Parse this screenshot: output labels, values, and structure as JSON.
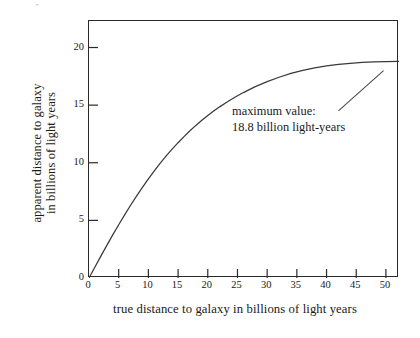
{
  "chart_data": {
    "type": "line",
    "title": "",
    "xlabel": "true distance to galaxy in billions of light years",
    "ylabel_line1": "apparent distance to galaxy",
    "ylabel_line2": "in billions of light years",
    "xlim": [
      0,
      52.2
    ],
    "ylim": [
      0,
      22.3
    ],
    "xticks": [
      0,
      5,
      10,
      15,
      20,
      25,
      30,
      35,
      40,
      45,
      50
    ],
    "xtick_labels": [
      "0",
      "5",
      "10",
      "15",
      "20",
      "25",
      "30",
      "35",
      "40",
      "45",
      "50"
    ],
    "yticks": [
      0,
      5,
      10,
      15,
      20
    ],
    "ytick_labels": [
      "0",
      "5",
      "10",
      "15",
      "20"
    ],
    "grid": false,
    "legend": "none",
    "line_color": "#3a3a3a",
    "frame_color": "#2a2a2a",
    "annotations": [
      {
        "line1": "maximum value:",
        "line2": "18.8 billion light-years",
        "leader_from_x": 42.0,
        "leader_from_y": 14.5,
        "leader_to_x": 49.6,
        "leader_to_y": 18.0
      }
    ],
    "asymptote_value": 18.8,
    "x": [
      0,
      1,
      2,
      3,
      4,
      5,
      6,
      7,
      8,
      9,
      10,
      11,
      12,
      13,
      14,
      15,
      16,
      17,
      18,
      19,
      20,
      21,
      22,
      23,
      24,
      25,
      26,
      27,
      28,
      30,
      32,
      34,
      36,
      38,
      40,
      42,
      44,
      46,
      48,
      50,
      52.2
    ],
    "y": [
      0,
      0.95,
      1.9,
      2.83,
      3.74,
      4.62,
      5.48,
      6.31,
      7.11,
      7.87,
      8.6,
      9.3,
      9.96,
      10.59,
      11.18,
      11.74,
      12.27,
      12.77,
      13.24,
      13.68,
      14.1,
      14.49,
      14.85,
      15.19,
      15.51,
      15.81,
      16.09,
      16.35,
      16.6,
      17.04,
      17.42,
      17.75,
      18.02,
      18.24,
      18.41,
      18.54,
      18.63,
      18.7,
      18.75,
      18.78,
      18.8
    ],
    "series": [
      {
        "name": "apparent distance",
        "values": [
          0,
          0.95,
          1.9,
          2.83,
          3.74,
          4.62,
          5.48,
          6.31,
          7.11,
          7.87,
          8.6,
          9.3,
          9.96,
          10.59,
          11.18,
          11.74,
          12.27,
          12.77,
          13.24,
          13.68,
          14.1,
          14.49,
          14.85,
          15.19,
          15.51,
          15.81,
          16.09,
          16.35,
          16.6,
          17.04,
          17.42,
          17.75,
          18.02,
          18.24,
          18.41,
          18.54,
          18.63,
          18.7,
          18.75,
          18.78,
          18.8
        ]
      }
    ]
  },
  "stray_mark": "''"
}
